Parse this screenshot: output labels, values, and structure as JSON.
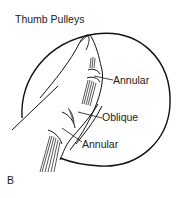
{
  "figure": {
    "title": "Thumb Pulleys",
    "panel_label": "B",
    "labels": [
      {
        "id": "annular-proximal-top",
        "text": "Annular"
      },
      {
        "id": "oblique",
        "text": "Oblique"
      },
      {
        "id": "annular-bottom",
        "text": "Annular"
      }
    ]
  }
}
